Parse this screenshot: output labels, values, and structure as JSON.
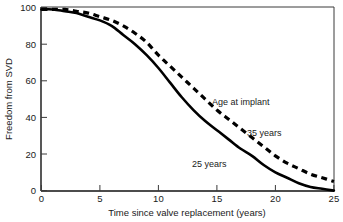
{
  "chart_data": {
    "type": "line",
    "title": "",
    "xlabel": "Time since valve replacement (years)",
    "ylabel": "Freedom from SVD",
    "xlim": [
      0,
      25
    ],
    "ylim": [
      0,
      100
    ],
    "xticks": [
      0,
      5,
      10,
      15,
      20,
      25
    ],
    "yticks": [
      0,
      20,
      40,
      60,
      80,
      100
    ],
    "xtick_labels": [
      "0",
      "5",
      "10",
      "15",
      "20",
      "25"
    ],
    "ytick_labels": [
      "0",
      "20",
      "40",
      "60",
      "80",
      "100"
    ],
    "grid": false,
    "legend_position": "inline-annotations",
    "x": [
      0,
      1,
      2,
      3,
      4,
      5,
      6,
      7,
      8,
      9,
      10,
      11,
      12,
      13,
      14,
      15,
      16,
      17,
      18,
      19,
      20,
      21,
      22,
      23,
      24,
      25
    ],
    "series": [
      {
        "name": "25 years",
        "style": "solid",
        "values": [
          99,
          99,
          98,
          97,
          95,
          93,
          90,
          85,
          80,
          74,
          67,
          59,
          51,
          44,
          38,
          33,
          28,
          23,
          19,
          14,
          10,
          7,
          4,
          2,
          1,
          0
        ]
      },
      {
        "name": "35 years",
        "style": "dashed",
        "values": [
          99,
          99,
          99,
          98,
          97,
          95,
          93,
          90,
          86,
          81,
          74,
          68,
          62,
          56,
          50,
          44,
          39,
          34,
          29,
          24,
          19,
          15,
          12,
          9,
          7,
          5
        ]
      }
    ],
    "annotations": [
      {
        "text": "Age at implant",
        "x": 25,
        "y": 50
      },
      {
        "text": "35 years",
        "x": 20,
        "y": 33
      },
      {
        "text": "25 years",
        "x": 13,
        "y": 17
      }
    ]
  }
}
